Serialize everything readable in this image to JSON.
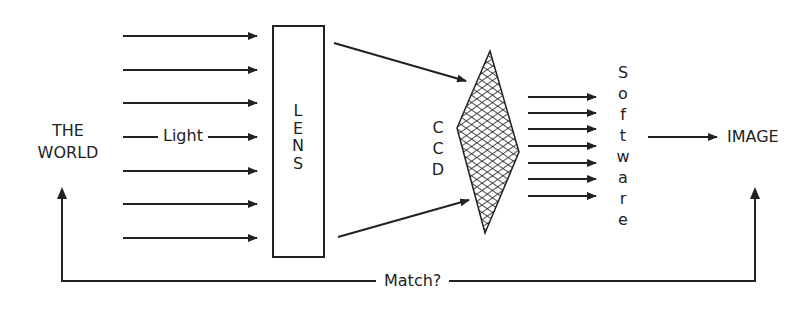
{
  "diagram": {
    "nodes": {
      "world": {
        "line1": "THE",
        "line2": "WORLD"
      },
      "light": "Light",
      "lens": [
        "L",
        "E",
        "N",
        "S"
      ],
      "ccd": [
        "C",
        "C",
        "D"
      ],
      "software": [
        "S",
        "o",
        "f",
        "t",
        "w",
        "a",
        "r",
        "e"
      ],
      "image": "IMAGE"
    },
    "feedback_label": "Match?",
    "colors": {
      "stroke": "#222222",
      "background": "#ffffff"
    },
    "light_ray_count": 7,
    "ccd_output_arrow_count": 7
  }
}
